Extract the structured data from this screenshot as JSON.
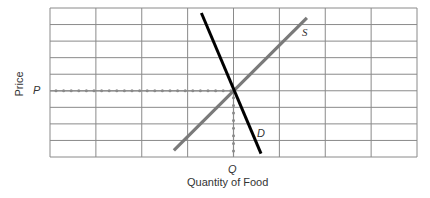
{
  "chart_data": {
    "type": "line",
    "title": "",
    "xlabel": "Quantity of Food",
    "ylabel": "Price",
    "grid": true,
    "grid_columns": 8,
    "grid_rows": 9,
    "xlim": [
      0,
      8
    ],
    "ylim": [
      0,
      9
    ],
    "series": [
      {
        "name": "S",
        "label": "S",
        "description": "Supply curve (upward sloping)",
        "color": "#7a7a7a",
        "points": [
          [
            2.7,
            0.4
          ],
          [
            5.6,
            8.4
          ]
        ]
      },
      {
        "name": "D",
        "label": "D",
        "description": "Demand curve (downward sloping)",
        "color": "#000000",
        "points": [
          [
            3.3,
            8.7
          ],
          [
            4.6,
            0.2
          ]
        ]
      }
    ],
    "equilibrium": {
      "x": 4,
      "y": 4,
      "x_label": "Q",
      "y_label": "P",
      "guide_lines": "dotted"
    },
    "annotations": [
      "P",
      "Q",
      "S",
      "D"
    ]
  },
  "labels": {
    "y_axis": "Price",
    "x_axis": "Quantity of Food",
    "p_marker": "P",
    "q_marker": "Q",
    "supply": "S",
    "demand": "D"
  },
  "colors": {
    "grid": "#8a8a8a",
    "supply": "#7a7a7a",
    "demand": "#000000",
    "guide": "#8a8a8a"
  }
}
